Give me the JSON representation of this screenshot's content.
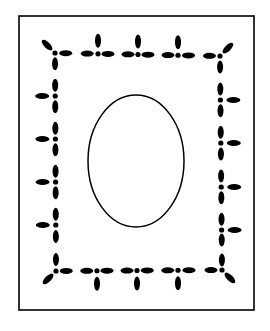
{
  "illustration": {
    "title": "Decorative rectangular frame with beaded border and central oval",
    "background_color": "#ffffff",
    "ink_color": "#000000",
    "outer_frame": {
      "x": 19,
      "y": 16,
      "width": 235,
      "height": 294,
      "stroke_width": 1.6
    },
    "oval": {
      "cx": 136,
      "cy": 161,
      "rx": 48,
      "ry": 66,
      "stroke_width": 1.5
    },
    "beaded_border": {
      "corners": {
        "top_left": [
          55,
          53
        ],
        "top_right": [
          220,
          56
        ],
        "bottom_left": [
          56,
          271
        ],
        "bottom_right": [
          222,
          270
        ]
      },
      "bead_rx": 6.5,
      "bead_ry": 3,
      "node_r": 2.6,
      "stem_rx": 3,
      "stem_ry": 7,
      "stem_offset": 13,
      "corner_leaf_offset": 11,
      "top_stems_x": [
        98,
        138,
        178
      ],
      "bottom_stems_x": [
        97,
        137,
        178
      ],
      "left_stems_y": [
        96,
        139,
        182,
        225
      ],
      "right_stems_y": [
        100,
        143,
        187,
        230
      ]
    }
  }
}
